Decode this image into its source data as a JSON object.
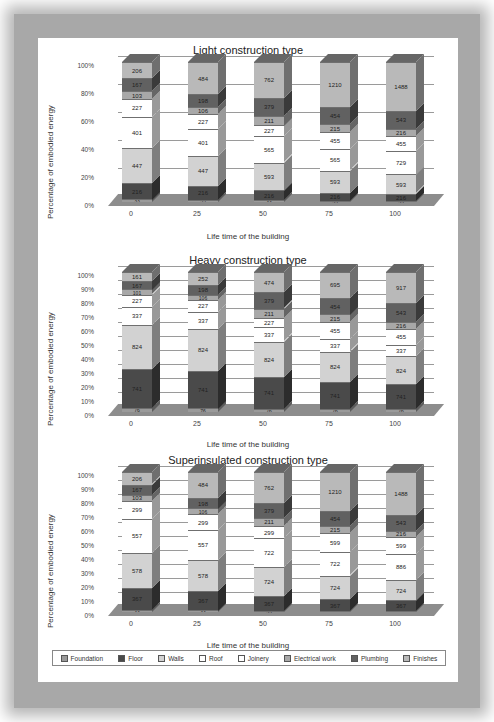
{
  "legend": {
    "items": [
      {
        "label": "Foundation",
        "color": "#9a9a9a"
      },
      {
        "label": "Floor",
        "color": "#4a4a4a"
      },
      {
        "label": "Walls",
        "color": "#d2d2d2"
      },
      {
        "label": "Roof",
        "color": "#ffffff"
      },
      {
        "label": "Joinery",
        "color": "#ffffff"
      },
      {
        "label": "Electrical work",
        "color": "#a8a8a8"
      },
      {
        "label": "Plumbing",
        "color": "#616161"
      },
      {
        "label": "Finishes",
        "color": "#b9b9b9"
      }
    ]
  },
  "chart_data": [
    {
      "type": "bar",
      "stacked": "percent",
      "title": "Light construction type",
      "xlabel": "Life time of the building",
      "ylabel": "Percentage of embodied energy",
      "yticks": [
        "0%",
        "20%",
        "40%",
        "60%",
        "80%",
        "100%"
      ],
      "ylim": [
        0,
        100
      ],
      "categories": [
        "0",
        "25",
        "50",
        "75",
        "100"
      ],
      "series": [
        {
          "name": "Foundation",
          "values": [
            33,
            33,
            33,
            33,
            33
          ]
        },
        {
          "name": "Floor",
          "values": [
            216,
            216,
            216,
            216,
            216
          ]
        },
        {
          "name": "Walls",
          "values": [
            447,
            447,
            593,
            593,
            593
          ]
        },
        {
          "name": "Roof",
          "values": [
            401,
            401,
            565,
            565,
            729
          ]
        },
        {
          "name": "Joinery",
          "values": [
            227,
            227,
            227,
            455,
            455
          ]
        },
        {
          "name": "Electrical work",
          "values": [
            103,
            106,
            211,
            215,
            216
          ]
        },
        {
          "name": "Plumbing",
          "values": [
            167,
            198,
            379,
            454,
            543
          ]
        },
        {
          "name": "Finishes",
          "values": [
            206,
            484,
            762,
            1210,
            1488
          ]
        }
      ],
      "legend_position": "bottom",
      "grid": true
    },
    {
      "type": "bar",
      "stacked": "percent",
      "title": "Heavy construction type",
      "xlabel": "Life time of the building",
      "ylabel": "Percentage of embodied energy",
      "yticks": [
        "0%",
        "10%",
        "20%",
        "30%",
        "40%",
        "50%",
        "60%",
        "70%",
        "80%",
        "90%",
        "100%"
      ],
      "ylim": [
        0,
        100
      ],
      "categories": [
        "0",
        "25",
        "50",
        "75",
        "100"
      ],
      "series": [
        {
          "name": "Foundation",
          "values": [
            76,
            76,
            76,
            76,
            76
          ]
        },
        {
          "name": "Floor",
          "values": [
            741,
            741,
            741,
            741,
            741
          ]
        },
        {
          "name": "Walls",
          "values": [
            824,
            824,
            824,
            824,
            824
          ]
        },
        {
          "name": "Roof",
          "values": [
            337,
            337,
            337,
            337,
            337
          ]
        },
        {
          "name": "Joinery",
          "values": [
            227,
            227,
            227,
            455,
            455
          ]
        },
        {
          "name": "Electrical work",
          "values": [
            101,
            106,
            211,
            215,
            216
          ]
        },
        {
          "name": "Plumbing",
          "values": [
            167,
            198,
            379,
            454,
            543
          ]
        },
        {
          "name": "Finishes",
          "values": [
            161,
            252,
            474,
            695,
            917
          ]
        }
      ],
      "legend_position": "bottom",
      "grid": true
    },
    {
      "type": "bar",
      "stacked": "percent",
      "title": "Superinsulated construction type",
      "xlabel": "Life time of the building",
      "ylabel": "Percentage of embodied energy",
      "yticks": [
        "0%",
        "10%",
        "20%",
        "30%",
        "40%",
        "50%",
        "60%",
        "70%",
        "80%",
        "90%",
        "100%"
      ],
      "ylim": [
        0,
        100
      ],
      "categories": [
        "0",
        "25",
        "50",
        "75",
        "100"
      ],
      "series": [
        {
          "name": "Foundation",
          "values": [
            33,
            33,
            33,
            33,
            33
          ]
        },
        {
          "name": "Floor",
          "values": [
            367,
            367,
            367,
            367,
            367
          ]
        },
        {
          "name": "Walls",
          "values": [
            578,
            578,
            724,
            724,
            724
          ]
        },
        {
          "name": "Roof",
          "values": [
            557,
            557,
            722,
            722,
            886
          ]
        },
        {
          "name": "Joinery",
          "values": [
            299,
            299,
            299,
            599,
            599
          ]
        },
        {
          "name": "Electrical work",
          "values": [
            103,
            106,
            211,
            215,
            216
          ]
        },
        {
          "name": "Plumbing",
          "values": [
            167,
            198,
            379,
            454,
            543
          ]
        },
        {
          "name": "Finishes",
          "values": [
            206,
            484,
            762,
            1210,
            1488
          ]
        }
      ],
      "legend_position": "bottom",
      "grid": true
    }
  ]
}
